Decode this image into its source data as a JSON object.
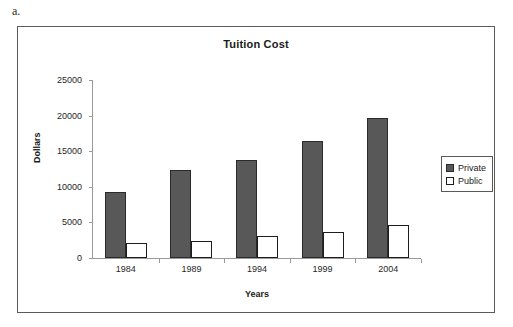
{
  "figure_label": "a.",
  "chart_data": {
    "type": "bar",
    "title": "Tuition Cost",
    "xlabel": "Years",
    "ylabel": "Dollars",
    "categories": [
      "1984",
      "1989",
      "1994",
      "1999",
      "2004"
    ],
    "series": [
      {
        "name": "Private",
        "values": [
          9300,
          12300,
          13800,
          16400,
          19600
        ],
        "color": "#585858"
      },
      {
        "name": "Public",
        "values": [
          2100,
          2400,
          3100,
          3700,
          4700
        ],
        "color": "#ffffff"
      }
    ],
    "ylim": [
      0,
      25000
    ],
    "yticks": [
      "0",
      "5000",
      "10000",
      "15000",
      "20000",
      "25000"
    ],
    "grid": false,
    "legend_position": "right"
  }
}
